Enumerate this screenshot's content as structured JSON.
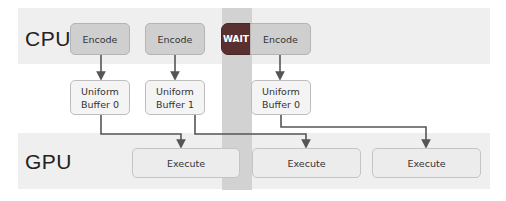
{
  "lanes": {
    "cpu_label": "CPU",
    "gpu_label": "GPU"
  },
  "cpu": {
    "encode_blocks": [
      {
        "label": "Encode"
      },
      {
        "label": "Encode"
      },
      {
        "label": "Encode"
      }
    ],
    "wait_label": "WAIT"
  },
  "buffers": [
    {
      "line1": "Uniform",
      "line2": "Buffer 0"
    },
    {
      "line1": "Uniform",
      "line2": "Buffer 1"
    },
    {
      "line1": "Uniform",
      "line2": "Buffer 0"
    }
  ],
  "gpu": {
    "execute_blocks": [
      {
        "label": "Execute"
      },
      {
        "label": "Execute"
      },
      {
        "label": "Execute"
      }
    ]
  },
  "colors": {
    "wait": "#5a2f30",
    "arrow": "#555555",
    "band": "#efefef",
    "stall_stripe": "#d2d2d2"
  }
}
